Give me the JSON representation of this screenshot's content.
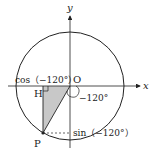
{
  "diagram": {
    "axes": {
      "x_label": "x",
      "y_label": "y",
      "origin_label": "O"
    },
    "points": {
      "P": "P",
      "H": "H"
    },
    "angle_label": "−120°",
    "cos_label": "cos（−120°）",
    "sin_label": "sin（−120°）",
    "colors": {
      "stroke": "#222222",
      "triangle_fill": "#c8c8c8",
      "background": "#ffffff"
    }
  }
}
